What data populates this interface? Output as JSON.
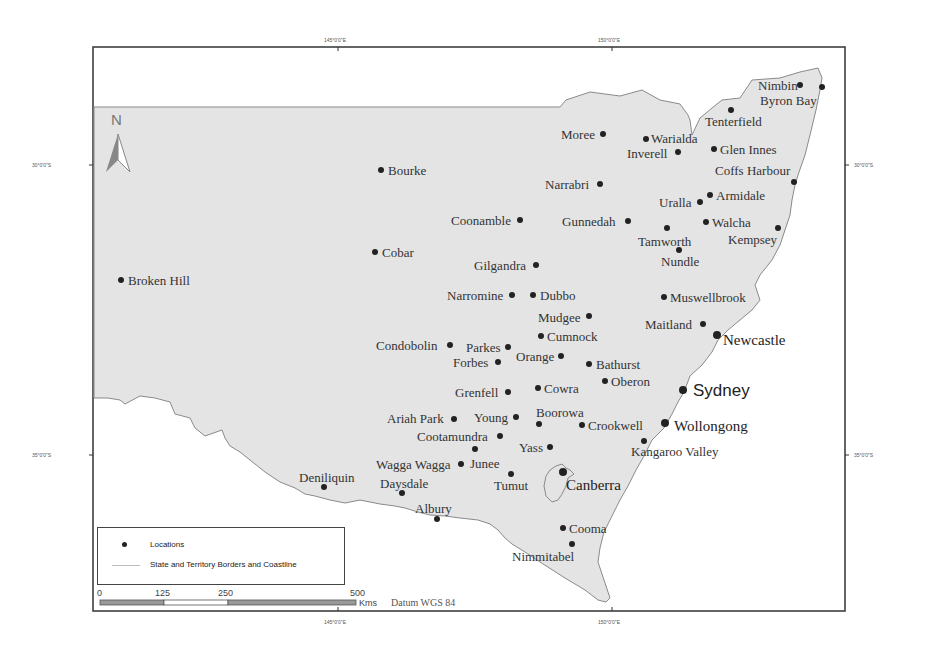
{
  "map": {
    "title": "",
    "north_arrow_label": "N",
    "graticule": {
      "top": [
        "145°0'0\"E",
        "150°0'0\"E"
      ],
      "bottom": [
        "145°0'0\"E",
        "150°0'0\"E"
      ],
      "left": [
        "30°0'0\"S",
        "35°0'0\"S"
      ],
      "right": [
        "30°0'0\"S",
        "35°0'0\"S"
      ]
    },
    "colors": {
      "land": "#e4e4e4",
      "sea": "#ffffff",
      "border": "#888888",
      "dot": "#222222",
      "text": "#333333"
    },
    "locations": [
      {
        "name": "Nimbin",
        "x": 800,
        "y": 85,
        "lx": 758,
        "ly": 79,
        "size": "normal"
      },
      {
        "name": "Byron Bay",
        "x": 822,
        "y": 87,
        "lx": 760,
        "ly": 94,
        "size": "normal"
      },
      {
        "name": "Tenterfield",
        "x": 731,
        "y": 110,
        "lx": 705,
        "ly": 115,
        "size": "normal"
      },
      {
        "name": "Moree",
        "x": 603,
        "y": 134,
        "lx": 561,
        "ly": 128,
        "size": "normal"
      },
      {
        "name": "Warialda",
        "x": 646,
        "y": 139,
        "lx": 651,
        "ly": 132,
        "size": "normal"
      },
      {
        "name": "Inverell",
        "x": 678,
        "y": 152,
        "lx": 627,
        "ly": 147,
        "size": "normal"
      },
      {
        "name": "Glen Innes",
        "x": 714,
        "y": 149,
        "lx": 720,
        "ly": 143,
        "size": "normal"
      },
      {
        "name": "Coffs Harbour",
        "x": 794,
        "y": 182,
        "lx": 715,
        "ly": 164,
        "size": "normal"
      },
      {
        "name": "Bourke",
        "x": 381,
        "y": 170,
        "lx": 388,
        "ly": 164,
        "size": "normal"
      },
      {
        "name": "Narrabri",
        "x": 600,
        "y": 184,
        "lx": 545,
        "ly": 178,
        "size": "normal"
      },
      {
        "name": "Armidale",
        "x": 710,
        "y": 195,
        "lx": 716,
        "ly": 189,
        "size": "normal"
      },
      {
        "name": "Uralla",
        "x": 700,
        "y": 202,
        "lx": 659,
        "ly": 196,
        "size": "normal"
      },
      {
        "name": "Coonamble",
        "x": 520,
        "y": 220,
        "lx": 451,
        "ly": 214,
        "size": "normal"
      },
      {
        "name": "Gunnedah",
        "x": 628,
        "y": 221,
        "lx": 562,
        "ly": 215,
        "size": "normal"
      },
      {
        "name": "Walcha",
        "x": 706,
        "y": 222,
        "lx": 712,
        "ly": 216,
        "size": "normal"
      },
      {
        "name": "Tamworth",
        "x": 667,
        "y": 228,
        "lx": 638,
        "ly": 235,
        "size": "normal"
      },
      {
        "name": "Kempsey",
        "x": 778,
        "y": 228,
        "lx": 728,
        "ly": 233,
        "size": "normal"
      },
      {
        "name": "Cobar",
        "x": 375,
        "y": 252,
        "lx": 382,
        "ly": 246,
        "size": "normal"
      },
      {
        "name": "Nundle",
        "x": 679,
        "y": 250,
        "lx": 661,
        "ly": 255,
        "size": "normal"
      },
      {
        "name": "Gilgandra",
        "x": 536,
        "y": 265,
        "lx": 474,
        "ly": 259,
        "size": "normal"
      },
      {
        "name": "Broken Hill",
        "x": 121,
        "y": 280,
        "lx": 128,
        "ly": 274,
        "size": "normal"
      },
      {
        "name": "Narromine",
        "x": 512,
        "y": 295,
        "lx": 447,
        "ly": 289,
        "size": "normal"
      },
      {
        "name": "Dubbo",
        "x": 533,
        "y": 295,
        "lx": 540,
        "ly": 289,
        "size": "normal"
      },
      {
        "name": "Muswellbrook",
        "x": 664,
        "y": 297,
        "lx": 670,
        "ly": 291,
        "size": "normal"
      },
      {
        "name": "Mudgee",
        "x": 589,
        "y": 316,
        "lx": 538,
        "ly": 311,
        "size": "normal"
      },
      {
        "name": "Maitland",
        "x": 703,
        "y": 324,
        "lx": 645,
        "ly": 318,
        "size": "normal"
      },
      {
        "name": "Cumnock",
        "x": 541,
        "y": 336,
        "lx": 547,
        "ly": 330,
        "size": "normal"
      },
      {
        "name": "Newcastle",
        "x": 717,
        "y": 335,
        "lx": 723,
        "ly": 333,
        "size": "big"
      },
      {
        "name": "Condobolin",
        "x": 450,
        "y": 345,
        "lx": 376,
        "ly": 339,
        "size": "normal"
      },
      {
        "name": "Parkes",
        "x": 508,
        "y": 347,
        "lx": 466,
        "ly": 341,
        "size": "normal"
      },
      {
        "name": "Orange",
        "x": 561,
        "y": 356,
        "lx": 516,
        "ly": 350,
        "size": "normal"
      },
      {
        "name": "Forbes",
        "x": 498,
        "y": 362,
        "lx": 453,
        "ly": 356,
        "size": "normal"
      },
      {
        "name": "Bathurst",
        "x": 589,
        "y": 364,
        "lx": 596,
        "ly": 358,
        "size": "normal"
      },
      {
        "name": "Oberon",
        "x": 605,
        "y": 381,
        "lx": 611,
        "ly": 375,
        "size": "normal"
      },
      {
        "name": "Sydney",
        "x": 683,
        "y": 390,
        "lx": 693,
        "ly": 382,
        "size": "sydney"
      },
      {
        "name": "Grenfell",
        "x": 508,
        "y": 392,
        "lx": 455,
        "ly": 386,
        "size": "normal"
      },
      {
        "name": "Cowra",
        "x": 538,
        "y": 388,
        "lx": 544,
        "ly": 382,
        "size": "normal"
      },
      {
        "name": "Ariah Park",
        "x": 454,
        "y": 419,
        "lx": 387,
        "ly": 412,
        "size": "normal"
      },
      {
        "name": "Young",
        "x": 516,
        "y": 417,
        "lx": 474,
        "ly": 411,
        "size": "normal"
      },
      {
        "name": "Boorowa",
        "x": 539,
        "y": 424,
        "lx": 536,
        "ly": 406,
        "size": "normal"
      },
      {
        "name": "Crookwell",
        "x": 582,
        "y": 425,
        "lx": 588,
        "ly": 419,
        "size": "normal"
      },
      {
        "name": "Wollongong",
        "x": 665,
        "y": 423,
        "lx": 674,
        "ly": 419,
        "size": "big"
      },
      {
        "name": "Cootamundra",
        "x": 500,
        "y": 436,
        "lx": 417,
        "ly": 430,
        "size": "normal"
      },
      {
        "name": "Kangaroo Valley",
        "x": 644,
        "y": 441,
        "lx": 631,
        "ly": 445,
        "size": "normal"
      },
      {
        "name": "Yass",
        "x": 550,
        "y": 447,
        "lx": 519,
        "ly": 441,
        "size": "normal"
      },
      {
        "name": "Junee",
        "x": 475,
        "y": 449,
        "lx": 470,
        "ly": 457,
        "size": "normal"
      },
      {
        "name": "Wagga Wagga",
        "x": 461,
        "y": 464,
        "lx": 376,
        "ly": 458,
        "size": "normal"
      },
      {
        "name": "Tumut",
        "x": 511,
        "y": 474,
        "lx": 494,
        "ly": 479,
        "size": "normal"
      },
      {
        "name": "Canberra",
        "x": 563,
        "y": 472,
        "lx": 566,
        "ly": 478,
        "size": "big"
      },
      {
        "name": "Deniliquin",
        "x": 324,
        "y": 487,
        "lx": 299,
        "ly": 471,
        "size": "normal"
      },
      {
        "name": "Daysdale",
        "x": 402,
        "y": 493,
        "lx": 380,
        "ly": 477,
        "size": "normal"
      },
      {
        "name": "Albury",
        "x": 437,
        "y": 519,
        "lx": 415,
        "ly": 502,
        "size": "normal"
      },
      {
        "name": "Cooma",
        "x": 563,
        "y": 528,
        "lx": 569,
        "ly": 522,
        "size": "normal"
      },
      {
        "name": "Nimmitabel",
        "x": 572,
        "y": 544,
        "lx": 512,
        "ly": 550,
        "size": "normal"
      }
    ]
  },
  "legend": {
    "items": [
      {
        "symbol": "dot",
        "label": "Locations"
      },
      {
        "symbol": "line",
        "label": "State and Territory Borders and Coastline"
      }
    ]
  },
  "scale_bar": {
    "ticks": [
      "0",
      "125",
      "250",
      "500"
    ],
    "unit": "Kms",
    "datum": "Datum WGS 84"
  }
}
